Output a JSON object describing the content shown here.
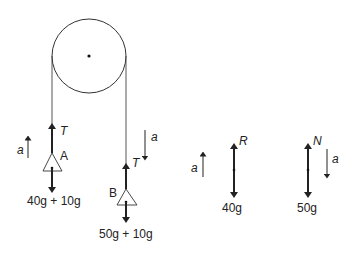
{
  "diagram": {
    "pulley": {
      "cx": 89,
      "cy": 56,
      "r": 37
    },
    "mass_a": {
      "label": "A",
      "tension_label": "T",
      "accel_label": "a",
      "accel_direction": "up",
      "weight_label": "40g + 10g"
    },
    "mass_b": {
      "label": "B",
      "tension_label": "T",
      "accel_label": "a",
      "accel_direction": "down",
      "weight_label": "50g + 10g"
    },
    "fbd_1": {
      "force_up_label": "R",
      "weight_label": "40g",
      "accel_label": "a",
      "accel_direction": "up"
    },
    "fbd_2": {
      "force_up_label": "N",
      "weight_label": "50g",
      "accel_label": "a",
      "accel_direction": "down"
    },
    "colors": {
      "line": "#222222",
      "background": "#ffffff"
    }
  }
}
